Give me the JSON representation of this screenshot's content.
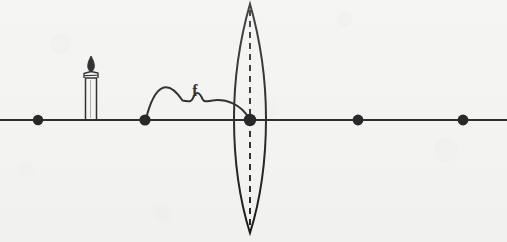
{
  "figure": {
    "caption": "",
    "background_color": "#f3f3f2",
    "ink_color": "#1a1a1a"
  },
  "labels": {
    "focal_length": "f"
  },
  "optical_axis": {
    "name": "optical-axis",
    "y": 120,
    "x_start": 0,
    "x_end": 507,
    "stroke_width": 2.1
  },
  "axis_points": [
    {
      "id": "point-2f-left",
      "label": "",
      "cx": 38,
      "cy": 120,
      "r": 5.2
    },
    {
      "id": "point-f-left",
      "label": "",
      "cx": 145,
      "cy": 120,
      "r": 5.6
    },
    {
      "id": "point-lens-center",
      "label": "",
      "cx": 250,
      "cy": 120,
      "r": 6.2
    },
    {
      "id": "point-f-right",
      "label": "",
      "cx": 358,
      "cy": 120,
      "r": 5.4
    },
    {
      "id": "point-2f-right",
      "label": "",
      "cx": 463,
      "cy": 120,
      "r": 5.4
    }
  ],
  "lens": {
    "name": "converging-lens",
    "type": "biconvex",
    "center_x": 250,
    "top_y": 4,
    "bottom_y": 233,
    "half_width": 16,
    "stroke_width": 2.0,
    "dashed_axis": {
      "x": 250,
      "y_start": 10,
      "y_end": 228,
      "dash": "6 5",
      "stroke_width": 1.9
    }
  },
  "focal_bracket": {
    "name": "focal-length-bracket",
    "from_x": 145,
    "to_x": 250,
    "baseline_y": 120,
    "apex_y": 100,
    "notch_y": 93,
    "label": "f",
    "label_x": 195,
    "label_y": 96,
    "stroke_width": 2.0
  },
  "candle": {
    "name": "candle-object",
    "base_y": 120,
    "body_top_y": 78,
    "body_left_x": 85,
    "body_right_x": 97,
    "collar_top_y": 71,
    "flame_top_y": 56,
    "flame_bottom_y": 72,
    "flame_center_x": 91,
    "stroke_width": 1.4
  }
}
